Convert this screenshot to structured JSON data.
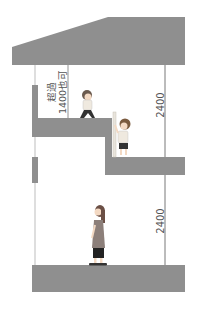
{
  "diagram": {
    "type": "section-view",
    "colors": {
      "structure": "#8f8f8f",
      "line": "#777777",
      "text": "#555555",
      "background": "#ffffff"
    },
    "labels": {
      "upper_dimension": "2400",
      "lower_dimension": "2400",
      "loft_note_line1": "超過",
      "loft_note_line2": "1400也可"
    },
    "figures": [
      {
        "name": "child-walking-on-loft"
      },
      {
        "name": "child-climbing-ladder"
      },
      {
        "name": "woman-standing-ground-floor"
      }
    ],
    "elements": [
      "roof",
      "loft-floor",
      "mid-floor",
      "ground-floor",
      "ladder",
      "left-wall",
      "dimension-lines"
    ]
  }
}
